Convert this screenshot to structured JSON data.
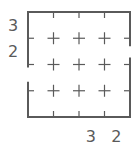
{
  "puzzle": {
    "rows": 4,
    "cols": 4,
    "colors": {
      "line": "#5a5a5a",
      "clue": "#5a5a5a",
      "background": "#ffffff"
    },
    "left_clues": [
      "3",
      "2",
      "",
      ""
    ],
    "bottom_clues": [
      "",
      "",
      "3",
      "2"
    ],
    "open_edges": {
      "left_rows": [
        2
      ],
      "right_rows": [
        1
      ],
      "top_cols": [],
      "bottom_cols": []
    },
    "icons": {
      "interior_marker": "plus-icon",
      "edge_marker": "tick-icon"
    }
  }
}
